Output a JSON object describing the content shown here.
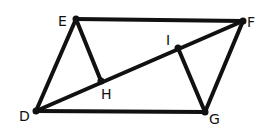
{
  "diagram": {
    "type": "geometry",
    "points": {
      "D": {
        "label": "D",
        "x": 36,
        "y": 111
      },
      "E": {
        "label": "E",
        "x": 76,
        "y": 19
      },
      "F": {
        "label": "F",
        "x": 243,
        "y": 21
      },
      "G": {
        "label": "G",
        "x": 205,
        "y": 112
      },
      "H": {
        "label": "H",
        "x": 101,
        "y": 81
      },
      "I": {
        "label": "I",
        "x": 178,
        "y": 48
      }
    },
    "segments": [
      [
        "D",
        "E"
      ],
      [
        "E",
        "F"
      ],
      [
        "F",
        "G"
      ],
      [
        "G",
        "D"
      ],
      [
        "D",
        "F"
      ],
      [
        "E",
        "H"
      ],
      [
        "G",
        "I"
      ]
    ],
    "colors": {
      "stroke": "#111111",
      "background": "#ffffff"
    }
  }
}
